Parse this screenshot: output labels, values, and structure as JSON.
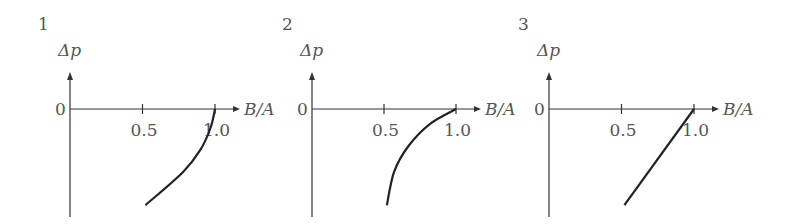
{
  "chart_data": [
    {
      "type": "line",
      "panel_label": "1",
      "xlabel": "B/A",
      "ylabel": "Δp",
      "origin_label": "0",
      "x_ticks": [
        "0.5",
        "1.0"
      ],
      "x_tick_values": [
        0.5,
        1.0
      ],
      "curve_shape": "concave-left arc",
      "points": [
        [
          1.0,
          0.0
        ],
        [
          0.97,
          -0.25
        ],
        [
          0.9,
          -0.55
        ],
        [
          0.78,
          -0.85
        ],
        [
          0.52,
          -1.3
        ]
      ]
    },
    {
      "type": "line",
      "panel_label": "2",
      "xlabel": "B/A",
      "ylabel": "Δp",
      "origin_label": "0",
      "x_ticks": [
        "0.5",
        "1.0"
      ],
      "x_tick_values": [
        0.5,
        1.0
      ],
      "curve_shape": "convex arc",
      "points": [
        [
          1.0,
          0.0
        ],
        [
          0.82,
          -0.2
        ],
        [
          0.67,
          -0.5
        ],
        [
          0.57,
          -0.85
        ],
        [
          0.52,
          -1.3
        ]
      ]
    },
    {
      "type": "line",
      "panel_label": "3",
      "xlabel": "B/A",
      "ylabel": "Δp",
      "origin_label": "0",
      "x_ticks": [
        "0.5",
        "1.0"
      ],
      "x_tick_values": [
        0.5,
        1.0
      ],
      "curve_shape": "straight line",
      "points": [
        [
          1.0,
          0.0
        ],
        [
          0.52,
          -1.3
        ]
      ]
    }
  ]
}
